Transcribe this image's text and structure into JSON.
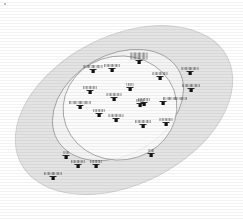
{
  "figure": {
    "type": "venn-scatter-diagram",
    "title": "",
    "background_color": "#ffffff"
  },
  "regions": [
    {
      "name": "outer-ellipse",
      "label": "",
      "fill": "#e3e3e3",
      "stroke": "#d2d2d2",
      "cx": 124,
      "cy": 110,
      "rx": 116,
      "ry": 74,
      "rotation": -27
    },
    {
      "name": "inner-ellipse-tilted",
      "label": "",
      "fill": "#f2f2f2",
      "stroke": "#9a9a9a",
      "cx": 118,
      "cy": 105,
      "rx": 70,
      "ry": 50,
      "rotation": -30
    },
    {
      "name": "inner-ellipse-round",
      "label": "",
      "fill": "#fbfbfb",
      "stroke": "#9a9a9a",
      "cx": 120,
      "cy": 108,
      "rx": 57,
      "ry": 52,
      "rotation": -8
    }
  ],
  "markers": [
    {
      "name": "marker-01",
      "label": "",
      "x": 93,
      "y": 71,
      "label_w": 19,
      "label_lines": 1,
      "label_align": "center"
    },
    {
      "name": "marker-02",
      "label": "",
      "x": 112,
      "y": 70,
      "label_w": 16,
      "label_lines": 1,
      "label_align": "center"
    },
    {
      "name": "marker-03",
      "label": "",
      "x": 139,
      "y": 62,
      "label_w": 17,
      "label_lines": 2,
      "label_align": "center"
    },
    {
      "name": "marker-04",
      "label": "",
      "x": 160,
      "y": 78,
      "label_w": 15,
      "label_lines": 1,
      "label_align": "center"
    },
    {
      "name": "marker-05",
      "label": "",
      "x": 190,
      "y": 73,
      "label_w": 17,
      "label_lines": 1,
      "label_align": "center"
    },
    {
      "name": "marker-06",
      "label": "",
      "x": 191,
      "y": 90,
      "label_w": 18,
      "label_lines": 1,
      "label_align": "center"
    },
    {
      "name": "marker-07",
      "label": "",
      "x": 130,
      "y": 89,
      "label_w": 7,
      "label_lines": 1,
      "label_align": "center"
    },
    {
      "name": "marker-08",
      "label": "",
      "x": 90,
      "y": 92,
      "label_w": 14,
      "label_lines": 1,
      "label_align": "center"
    },
    {
      "name": "marker-09",
      "label": "",
      "x": 114,
      "y": 99,
      "label_w": 15,
      "label_lines": 1,
      "label_align": "center"
    },
    {
      "name": "marker-10",
      "label": "",
      "x": 140,
      "y": 105,
      "label_w": 8,
      "label_lines": 1,
      "label_align": "center"
    },
    {
      "name": "marker-11",
      "label": "",
      "x": 80,
      "y": 107,
      "label_w": 22,
      "label_lines": 1,
      "label_align": "center"
    },
    {
      "name": "marker-12",
      "label": "",
      "x": 99,
      "y": 115,
      "label_w": 12,
      "label_lines": 1,
      "label_align": "center"
    },
    {
      "name": "marker-13",
      "label": "",
      "x": 116,
      "y": 120,
      "label_w": 15,
      "label_lines": 1,
      "label_align": "center"
    },
    {
      "name": "marker-14",
      "label": "",
      "x": 144,
      "y": 104,
      "label_w": 12,
      "label_lines": 1,
      "label_align": "center"
    },
    {
      "name": "marker-15",
      "label": "",
      "x": 163,
      "y": 103,
      "label_w": 24,
      "label_lines": 1,
      "label_align": "left"
    },
    {
      "name": "marker-16",
      "label": "",
      "x": 143,
      "y": 126,
      "label_w": 16,
      "label_lines": 1,
      "label_align": "center"
    },
    {
      "name": "marker-17",
      "label": "",
      "x": 166,
      "y": 124,
      "label_w": 13,
      "label_lines": 1,
      "label_align": "center"
    },
    {
      "name": "marker-18",
      "label": "",
      "x": 151,
      "y": 155,
      "label_w": 5,
      "label_lines": 1,
      "label_align": "center"
    },
    {
      "name": "marker-19",
      "label": "",
      "x": 66,
      "y": 157,
      "label_w": 5,
      "label_lines": 1,
      "label_align": "center"
    },
    {
      "name": "marker-20",
      "label": "",
      "x": 78,
      "y": 166,
      "label_w": 14,
      "label_lines": 1,
      "label_align": "center"
    },
    {
      "name": "marker-21",
      "label": "",
      "x": 96,
      "y": 166,
      "label_w": 12,
      "label_lines": 1,
      "label_align": "center"
    },
    {
      "name": "marker-22",
      "label": "",
      "x": 53,
      "y": 178,
      "label_w": 18,
      "label_lines": 1,
      "label_align": "center"
    }
  ]
}
